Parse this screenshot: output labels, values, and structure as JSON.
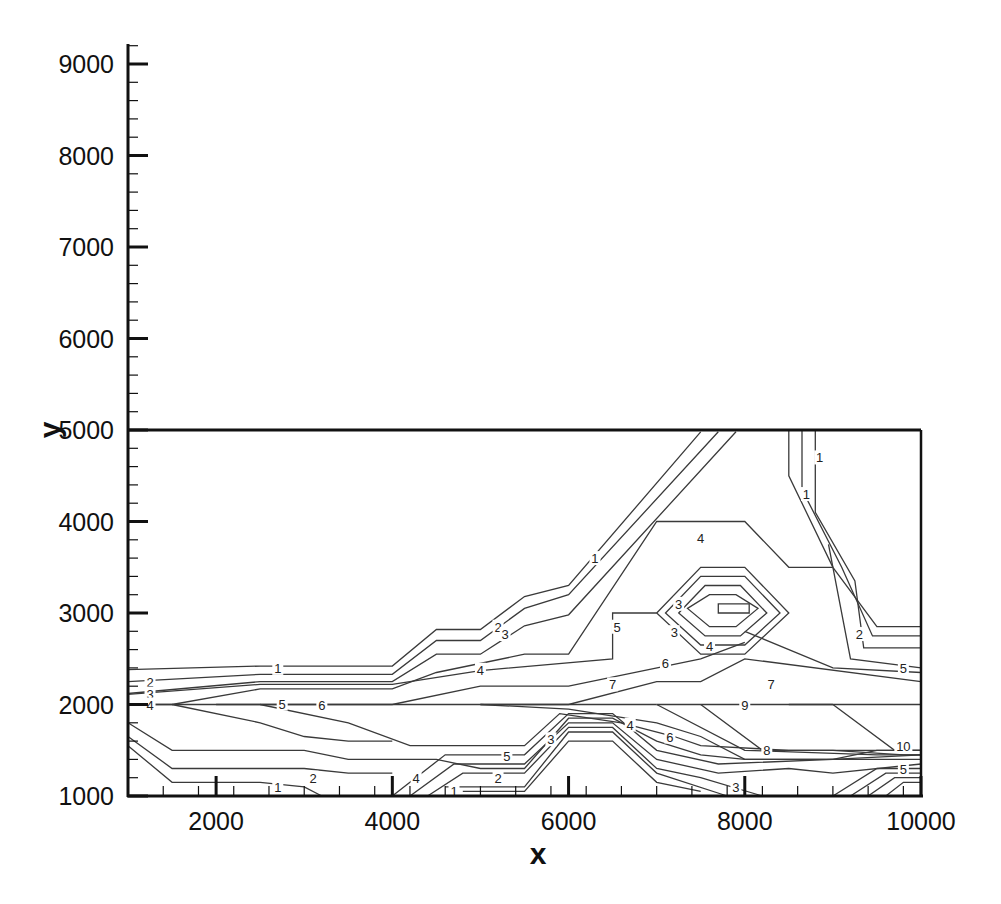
{
  "chart_data": {
    "type": "contour",
    "title": "",
    "xlabel": "x",
    "ylabel": "y",
    "xlim": [
      1000,
      10000
    ],
    "ylim": [
      1000,
      9200
    ],
    "frame_box": {
      "x": [
        1000,
        10000
      ],
      "y": [
        1000,
        5000
      ]
    },
    "x_major_ticks": [
      2000,
      4000,
      6000,
      8000,
      10000
    ],
    "x_tick_labels": [
      "2000",
      "4000",
      "6000",
      "8000",
      "10000"
    ],
    "x_minor_step": 400,
    "y_major_ticks": [
      1000,
      2000,
      3000,
      4000,
      5000,
      6000,
      7000,
      8000,
      9000
    ],
    "y_tick_labels": [
      "1000",
      "2000",
      "3000",
      "4000",
      "5000",
      "6000",
      "7000",
      "8000",
      "9000"
    ],
    "y_minor_step": 200,
    "grid": false,
    "legend": "none",
    "contour_levels": [
      1,
      2,
      3,
      4,
      5,
      6,
      7,
      8,
      9,
      10
    ],
    "contours": [
      {
        "level": 1,
        "points": [
          [
            1000,
            2380
          ],
          [
            2500,
            2420
          ],
          [
            4000,
            2420
          ],
          [
            4500,
            2820
          ],
          [
            5000,
            2820
          ],
          [
            5500,
            3180
          ],
          [
            6000,
            3300
          ],
          [
            7500,
            4980
          ]
        ]
      },
      {
        "level": 2,
        "points": [
          [
            1000,
            2250
          ],
          [
            2500,
            2330
          ],
          [
            4000,
            2330
          ],
          [
            4500,
            2700
          ],
          [
            5000,
            2700
          ],
          [
            5500,
            3050
          ],
          [
            6000,
            3200
          ],
          [
            7700,
            4980
          ]
        ]
      },
      {
        "level": 3,
        "points": [
          [
            1000,
            2120
          ],
          [
            2500,
            2250
          ],
          [
            4000,
            2250
          ],
          [
            4500,
            2550
          ],
          [
            5000,
            2550
          ],
          [
            5500,
            2860
          ],
          [
            6000,
            2980
          ],
          [
            7900,
            4980
          ]
        ]
      },
      {
        "level": 4,
        "points": [
          [
            1000,
            2000
          ],
          [
            1500,
            2000
          ],
          [
            2500,
            2170
          ],
          [
            4000,
            2170
          ],
          [
            4500,
            2350
          ],
          [
            5500,
            2550
          ],
          [
            6000,
            2550
          ],
          [
            7000,
            4000
          ],
          [
            8000,
            4000
          ],
          [
            8500,
            3500
          ],
          [
            9000,
            3500
          ]
        ]
      },
      {
        "level": 5,
        "points": [
          [
            2000,
            2000
          ],
          [
            4000,
            2000
          ]
        ]
      },
      {
        "level": 5,
        "points": [
          [
            1000,
            2110
          ],
          [
            2500,
            2220
          ],
          [
            4000,
            2220
          ],
          [
            5000,
            2370
          ],
          [
            6500,
            2500
          ],
          [
            6500,
            3000
          ],
          [
            7000,
            3000
          ]
        ]
      },
      {
        "level": 6,
        "points": [
          [
            1000,
            2000
          ],
          [
            7000,
            2000
          ]
        ]
      },
      {
        "level": 6,
        "points": [
          [
            4000,
            2000
          ],
          [
            5000,
            2200
          ],
          [
            6000,
            2200
          ],
          [
            7500,
            2500
          ],
          [
            8000,
            2680
          ]
        ]
      },
      {
        "level": 7,
        "points": [
          [
            5000,
            2000
          ],
          [
            6000,
            2000
          ],
          [
            7000,
            2250
          ],
          [
            7500,
            2250
          ],
          [
            8000,
            2500
          ],
          [
            10000,
            2250
          ]
        ]
      },
      {
        "level": 9,
        "points": [
          [
            7000,
            2000
          ],
          [
            8500,
            2000
          ],
          [
            9000,
            2000
          ]
        ]
      },
      {
        "level": 10,
        "points": [
          [
            8500,
            2000
          ],
          [
            10000,
            2000
          ]
        ]
      },
      {
        "level": "east-1",
        "points": [
          [
            8500,
            5000
          ],
          [
            8500,
            4500
          ],
          [
            9000,
            3500
          ],
          [
            9500,
            2850
          ],
          [
            10000,
            2850
          ]
        ]
      },
      {
        "level": "east-2",
        "points": [
          [
            8650,
            5000
          ],
          [
            8650,
            4350
          ],
          [
            9100,
            3500
          ],
          [
            9450,
            2750
          ],
          [
            10000,
            2750
          ]
        ]
      },
      {
        "level": "east-3",
        "points": [
          [
            8800,
            5000
          ],
          [
            8800,
            4100
          ],
          [
            9250,
            3350
          ],
          [
            9350,
            2620
          ],
          [
            10000,
            2620
          ]
        ]
      },
      {
        "level": "east-4",
        "points": [
          [
            8950,
            3750
          ],
          [
            9200,
            2500
          ],
          [
            10000,
            2400
          ]
        ]
      },
      {
        "level": "east-5",
        "points": [
          [
            8000,
            2800
          ],
          [
            9000,
            2400
          ],
          [
            10000,
            2350
          ]
        ]
      },
      {
        "level": "hex-1",
        "closed": true,
        "points": [
          [
            7500,
            3500
          ],
          [
            8000,
            3500
          ],
          [
            8500,
            3000
          ],
          [
            8000,
            2550
          ],
          [
            7500,
            2550
          ],
          [
            7000,
            3000
          ]
        ]
      },
      {
        "level": "hex-2",
        "closed": true,
        "points": [
          [
            7500,
            3400
          ],
          [
            8000,
            3400
          ],
          [
            8400,
            3000
          ],
          [
            8000,
            2650
          ],
          [
            7500,
            2650
          ],
          [
            7100,
            3000
          ]
        ]
      },
      {
        "level": "hex-3",
        "closed": true,
        "points": [
          [
            7550,
            3300
          ],
          [
            7950,
            3300
          ],
          [
            8250,
            3000
          ],
          [
            7950,
            2750
          ],
          [
            7550,
            2750
          ],
          [
            7250,
            3000
          ]
        ]
      },
      {
        "level": "hex-4",
        "closed": true,
        "points": [
          [
            7600,
            3200
          ],
          [
            7900,
            3200
          ],
          [
            8150,
            3050
          ],
          [
            7900,
            2850
          ],
          [
            7600,
            2850
          ],
          [
            7350,
            3050
          ]
        ]
      },
      {
        "level": "hex-5",
        "closed": true,
        "points": [
          [
            7700,
            3100
          ],
          [
            8050,
            3100
          ],
          [
            8050,
            3000
          ],
          [
            7700,
            3000
          ]
        ]
      },
      {
        "level": "low-a",
        "points": [
          [
            1000,
            1800
          ],
          [
            1500,
            1500
          ],
          [
            3000,
            1500
          ],
          [
            3500,
            1400
          ],
          [
            4500,
            1400
          ],
          [
            5000,
            1300
          ],
          [
            5500,
            1300
          ],
          [
            6000,
            1850
          ],
          [
            6500,
            1850
          ],
          [
            7000,
            1600
          ],
          [
            7500,
            1450
          ],
          [
            8000,
            1400
          ],
          [
            9000,
            1400
          ],
          [
            9500,
            1500
          ],
          [
            10000,
            1500
          ]
        ]
      },
      {
        "level": "low-b",
        "points": [
          [
            1000,
            1650
          ],
          [
            1500,
            1300
          ],
          [
            3000,
            1300
          ],
          [
            3500,
            1250
          ],
          [
            4000,
            1250
          ]
        ]
      },
      {
        "level": "low-c",
        "points": [
          [
            1000,
            1550
          ],
          [
            1500,
            1150
          ],
          [
            2500,
            1150
          ],
          [
            3000,
            1100
          ],
          [
            3200,
            1000
          ]
        ]
      },
      {
        "level": "low-d",
        "points": [
          [
            1500,
            2000
          ],
          [
            2500,
            1800
          ],
          [
            3000,
            1650
          ],
          [
            3500,
            1600
          ],
          [
            4000,
            1600
          ]
        ]
      },
      {
        "level": "low-e",
        "points": [
          [
            2500,
            2000
          ],
          [
            3500,
            1800
          ],
          [
            4200,
            1550
          ],
          [
            5500,
            1550
          ],
          [
            5900,
            1900
          ],
          [
            6600,
            1800
          ],
          [
            7200,
            1650
          ],
          [
            7500,
            1550
          ],
          [
            8500,
            1500
          ],
          [
            10000,
            1500
          ]
        ]
      },
      {
        "level": "low-f",
        "points": [
          [
            4400,
            1000
          ],
          [
            4800,
            1250
          ],
          [
            5500,
            1250
          ],
          [
            6000,
            1750
          ],
          [
            6500,
            1750
          ],
          [
            7000,
            1300
          ],
          [
            7500,
            1200
          ],
          [
            8200,
            1000
          ]
        ]
      },
      {
        "level": "low-g",
        "points": [
          [
            4200,
            1000
          ],
          [
            4700,
            1350
          ],
          [
            5500,
            1350
          ],
          [
            6000,
            1800
          ],
          [
            6500,
            1800
          ],
          [
            7000,
            1400
          ],
          [
            7700,
            1250
          ],
          [
            8500,
            1300
          ],
          [
            9000,
            1250
          ],
          [
            10000,
            1350
          ]
        ]
      },
      {
        "level": "low-h",
        "points": [
          [
            4000,
            1000
          ],
          [
            4600,
            1450
          ],
          [
            5500,
            1450
          ],
          [
            6000,
            1900
          ],
          [
            6500,
            1900
          ],
          [
            7000,
            1500
          ],
          [
            7700,
            1350
          ],
          [
            9000,
            1400
          ],
          [
            10000,
            1450
          ]
        ]
      },
      {
        "level": "low-i",
        "points": [
          [
            4600,
            1100
          ],
          [
            5500,
            1100
          ],
          [
            6000,
            1700
          ],
          [
            6500,
            1700
          ],
          [
            7000,
            1250
          ],
          [
            7800,
            1000
          ]
        ]
      },
      {
        "level": "low-j",
        "points": [
          [
            4800,
            1050
          ],
          [
            5500,
            1050
          ],
          [
            6000,
            1600
          ],
          [
            6500,
            1600
          ],
          [
            7000,
            1150
          ],
          [
            7500,
            1050
          ]
        ]
      },
      {
        "level": "low-k",
        "points": [
          [
            5000,
            2000
          ],
          [
            6000,
            1950
          ],
          [
            7000,
            1800
          ],
          [
            7500,
            1650
          ],
          [
            8000,
            1400
          ],
          [
            9000,
            1400
          ],
          [
            10000,
            1400
          ]
        ]
      },
      {
        "level": "low-l",
        "points": [
          [
            7000,
            2000
          ],
          [
            8000,
            1500
          ],
          [
            9500,
            1450
          ],
          [
            10000,
            1450
          ]
        ]
      },
      {
        "level": "low-m",
        "points": [
          [
            7500,
            2000
          ],
          [
            8200,
            1500
          ],
          [
            9000,
            1500
          ],
          [
            9800,
            1450
          ],
          [
            10000,
            1450
          ]
        ]
      },
      {
        "level": "low-n",
        "points": [
          [
            9000,
            1000
          ],
          [
            9500,
            1300
          ],
          [
            10000,
            1300
          ]
        ]
      },
      {
        "level": "low-o",
        "points": [
          [
            9200,
            1000
          ],
          [
            9600,
            1250
          ],
          [
            10000,
            1250
          ]
        ]
      },
      {
        "level": "low-p",
        "points": [
          [
            9400,
            1000
          ],
          [
            9700,
            1200
          ],
          [
            10000,
            1200
          ]
        ]
      },
      {
        "level": "low-q",
        "points": [
          [
            9600,
            1000
          ],
          [
            9800,
            1150
          ],
          [
            10000,
            1150
          ]
        ]
      },
      {
        "level": "low-r",
        "points": [
          [
            9000,
            2000
          ],
          [
            9700,
            1500
          ],
          [
            10000,
            1500
          ]
        ]
      }
    ],
    "contour_labels": [
      {
        "text": "1",
        "x": 2700,
        "y": 2400
      },
      {
        "text": "2",
        "x": 1250,
        "y": 2250
      },
      {
        "text": "3",
        "x": 1250,
        "y": 2120
      },
      {
        "text": "4",
        "x": 1250,
        "y": 2000
      },
      {
        "text": "5",
        "x": 2750,
        "y": 2010
      },
      {
        "text": "6",
        "x": 3200,
        "y": 2000
      },
      {
        "text": "4",
        "x": 5000,
        "y": 2380
      },
      {
        "text": "2",
        "x": 5200,
        "y": 2850
      },
      {
        "text": "3",
        "x": 5280,
        "y": 2770
      },
      {
        "text": "1",
        "x": 6300,
        "y": 3600
      },
      {
        "text": "4",
        "x": 7500,
        "y": 3820
      },
      {
        "text": "1",
        "x": 8850,
        "y": 4700
      },
      {
        "text": "1",
        "x": 8700,
        "y": 4300
      },
      {
        "text": "5",
        "x": 6550,
        "y": 2850
      },
      {
        "text": "3",
        "x": 7250,
        "y": 3100
      },
      {
        "text": "3",
        "x": 7200,
        "y": 2790
      },
      {
        "text": "4",
        "x": 7600,
        "y": 2640
      },
      {
        "text": "6",
        "x": 7100,
        "y": 2450
      },
      {
        "text": "7",
        "x": 6500,
        "y": 2220
      },
      {
        "text": "7",
        "x": 8300,
        "y": 2220
      },
      {
        "text": "2",
        "x": 9300,
        "y": 2770
      },
      {
        "text": "5",
        "x": 9800,
        "y": 2400
      },
      {
        "text": "9",
        "x": 8000,
        "y": 2000
      },
      {
        "text": "4",
        "x": 6700,
        "y": 1780
      },
      {
        "text": "6",
        "x": 7150,
        "y": 1650
      },
      {
        "text": "8",
        "x": 8250,
        "y": 1500
      },
      {
        "text": "10",
        "x": 9800,
        "y": 1550
      },
      {
        "text": "5",
        "x": 9800,
        "y": 1300
      },
      {
        "text": "3",
        "x": 7900,
        "y": 1100
      },
      {
        "text": "5",
        "x": 5300,
        "y": 1440
      },
      {
        "text": "3",
        "x": 5800,
        "y": 1620
      },
      {
        "text": "2",
        "x": 5200,
        "y": 1200
      },
      {
        "text": "1",
        "x": 4700,
        "y": 1060
      },
      {
        "text": "4",
        "x": 4270,
        "y": 1200
      },
      {
        "text": "1",
        "x": 2700,
        "y": 1100
      },
      {
        "text": "2",
        "x": 3100,
        "y": 1200
      }
    ]
  }
}
